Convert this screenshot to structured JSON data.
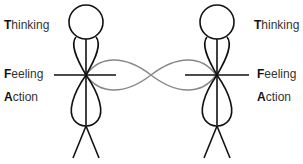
{
  "diagram": {
    "type": "two stick figures connected by infinity loop",
    "left_figure": {
      "labels": [
        {
          "initial": "T",
          "rest": "hinking",
          "text": "Thinking"
        },
        {
          "initial": "F",
          "rest": "eeling",
          "text": "Feeling"
        },
        {
          "initial": "A",
          "rest": "ction",
          "text": "Action"
        }
      ]
    },
    "right_figure": {
      "labels": [
        {
          "initial": "T",
          "rest": "hinking",
          "text": "Thinking"
        },
        {
          "initial": "F",
          "rest": "eeling",
          "text": "Feeling"
        },
        {
          "initial": "A",
          "rest": "ction",
          "text": "Action"
        }
      ]
    },
    "colors": {
      "figure_stroke": "#111111",
      "connector_stroke": "#888888",
      "text": "#333333"
    }
  }
}
